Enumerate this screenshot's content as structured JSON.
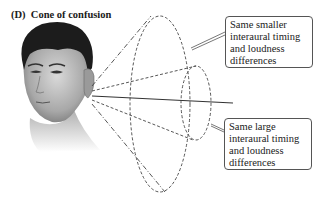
{
  "figure": {
    "panel_label": "(D)",
    "title": "Cone of confusion"
  },
  "callouts": [
    {
      "lines": [
        "Same smaller",
        "interaural timing",
        "and loudness",
        "differences"
      ],
      "refers_to": "outer-cone"
    },
    {
      "lines": [
        "Same large",
        "interaural timing",
        "and loudness",
        "differences"
      ],
      "refers_to": "inner-cone"
    }
  ],
  "colors": {
    "line": "#444444",
    "callout_border": "#555555",
    "text": "#222222"
  }
}
